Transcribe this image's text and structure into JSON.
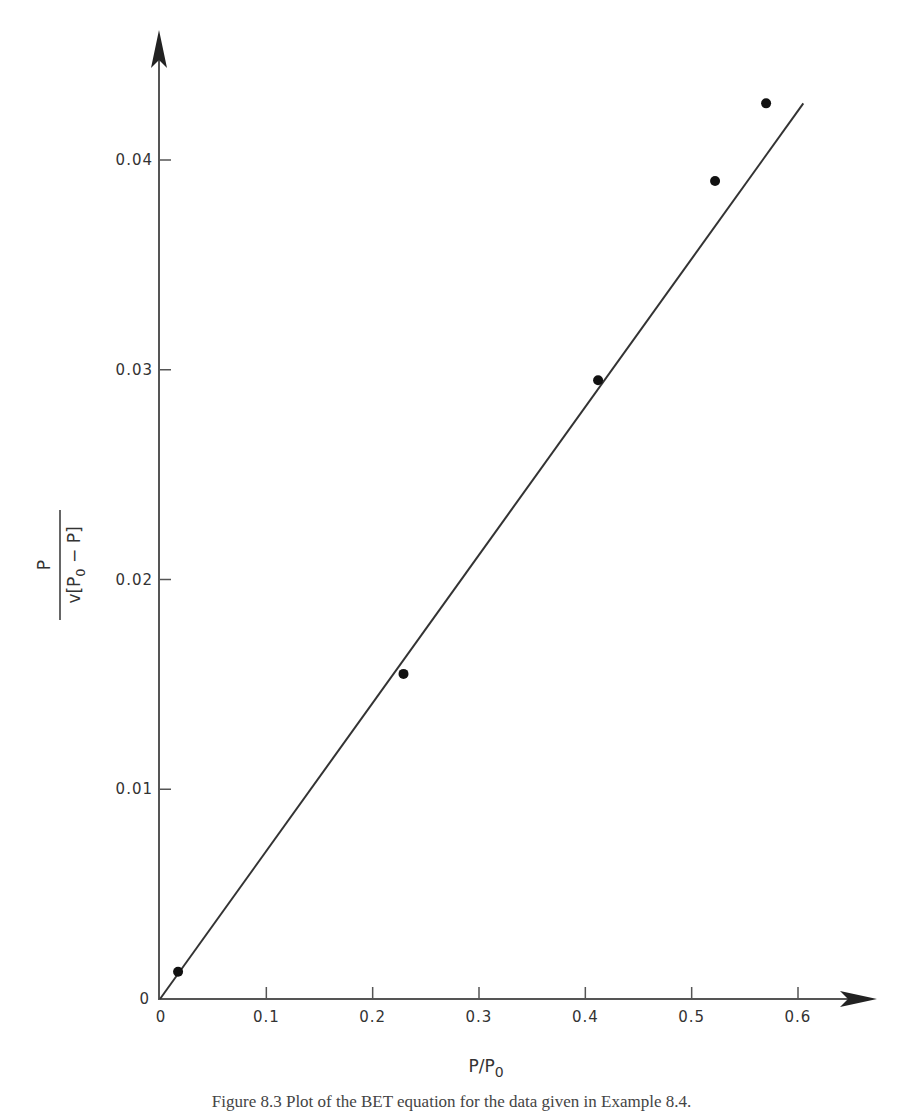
{
  "caption": "Figure 8.3  Plot of the BET equation for the data given in Example 8.4.",
  "axes": {
    "x_label_main": "P/P",
    "x_label_sub": "0",
    "y_label_numerator": "P",
    "y_label_denominator_prefix": "v[P",
    "y_label_denominator_sub": "0",
    "y_label_denominator_suffix": " − P]",
    "origin_x_label": "0",
    "origin_y_label": "0"
  },
  "chart_data": {
    "type": "scatter",
    "title": "",
    "xlabel": "P/P0",
    "ylabel": "P / v[P0 − P]",
    "xlim": [
      0,
      0.6
    ],
    "ylim": [
      0,
      0.04
    ],
    "x_ticks": [
      "0",
      "0.1",
      "0.2",
      "0.3",
      "0.4",
      "0.5",
      "0.6"
    ],
    "y_ticks": [
      "0",
      "0.01",
      "0.02",
      "0.03",
      "0.04"
    ],
    "grid": false,
    "legend": null,
    "series": [
      {
        "name": "BET data",
        "marker": "filled-circle",
        "points": [
          {
            "x": 0.017,
            "y": 0.0013
          },
          {
            "x": 0.229,
            "y": 0.0155
          },
          {
            "x": 0.412,
            "y": 0.0295
          },
          {
            "x": 0.522,
            "y": 0.039
          },
          {
            "x": 0.57,
            "y": 0.0427
          }
        ]
      },
      {
        "name": "BET fit line",
        "style": "line",
        "points": [
          {
            "x": 0.0,
            "y": 0.0
          },
          {
            "x": 0.605,
            "y": 0.0427
          }
        ]
      }
    ]
  }
}
